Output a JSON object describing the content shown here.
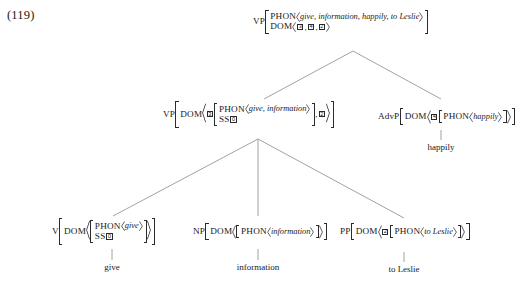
{
  "example_number": "(119)",
  "tree": {
    "root": {
      "label": "VP",
      "rows": [
        {
          "attr": "PHON",
          "value": "give, information, happily, to Leslie"
        },
        {
          "attr": "DOM",
          "tags": [
            "3",
            "4",
            "2"
          ]
        }
      ]
    },
    "vp_mid": {
      "label": "VP",
      "attr": "DOM",
      "tag": "3",
      "rows": [
        {
          "attr": "PHON",
          "value": "give, information"
        },
        {
          "attr": "SS",
          "tag": "0"
        }
      ],
      "trailing_tag": "2"
    },
    "advp": {
      "label": "AdvP",
      "attr": "DOM",
      "tag": "4",
      "rows": [
        {
          "attr": "PHON",
          "value": "happily"
        }
      ]
    },
    "v": {
      "label": "V",
      "attr": "DOM",
      "rows": [
        {
          "attr": "PHON",
          "value": "give"
        },
        {
          "attr": "SS",
          "tag": "0"
        }
      ]
    },
    "np": {
      "label": "NP",
      "attr": "DOM",
      "rows": [
        {
          "attr": "PHON",
          "value": "information"
        }
      ]
    },
    "pp": {
      "label": "PP",
      "attr": "DOM",
      "tag": "2",
      "rows": [
        {
          "attr": "PHON",
          "value": "to Leslie"
        }
      ]
    }
  },
  "terminals": {
    "give": "give",
    "information": "information",
    "happily": "happily",
    "to_leslie": "to Leslie"
  },
  "colors": {
    "ink": "#1a1a1a",
    "line": "#8a8a8a",
    "bracket": "#2b2b2b"
  }
}
